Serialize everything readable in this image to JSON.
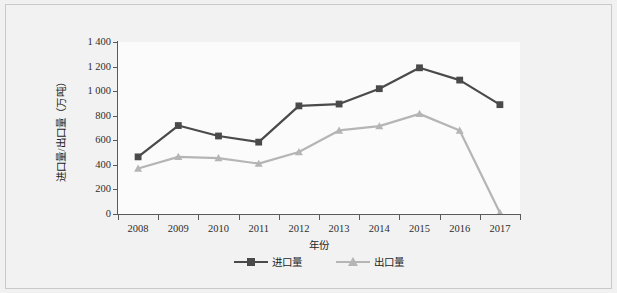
{
  "figure": {
    "background_color": "#f1f1f1",
    "plot_background_color": "#fbfbfb",
    "border_color": "#c9c9c9",
    "axis_color": "#5a5a5a"
  },
  "chart_data": {
    "type": "line",
    "title": "",
    "subtitle": "",
    "xlabel": "年份",
    "ylabel": "进口量/出口量（万吨）",
    "categories": [
      "2008",
      "2009",
      "2010",
      "2011",
      "2012",
      "2013",
      "2014",
      "2015",
      "2016",
      "2017"
    ],
    "ylim": [
      0,
      1400
    ],
    "ytick_values": [
      0,
      200,
      400,
      600,
      800,
      1000,
      1200,
      1400
    ],
    "ytick_labels": [
      "0",
      "200",
      "400",
      "600",
      "800",
      "1 000",
      "1 200",
      "1 400"
    ],
    "grid": false,
    "legend_position": "bottom-center",
    "series": [
      {
        "name": "进口量",
        "color": "#4a4a4a",
        "marker": "square",
        "values": [
          465,
          720,
          635,
          585,
          880,
          895,
          1020,
          1190,
          1090,
          890
        ]
      },
      {
        "name": "出口量",
        "color": "#b5b5b5",
        "marker": "triangle",
        "values": [
          370,
          465,
          455,
          410,
          505,
          680,
          715,
          815,
          680,
          10
        ]
      }
    ]
  },
  "legend": {
    "items": [
      {
        "label": "进口量",
        "icon": "square-marker-icon"
      },
      {
        "label": "出口量",
        "icon": "triangle-marker-icon"
      }
    ]
  }
}
